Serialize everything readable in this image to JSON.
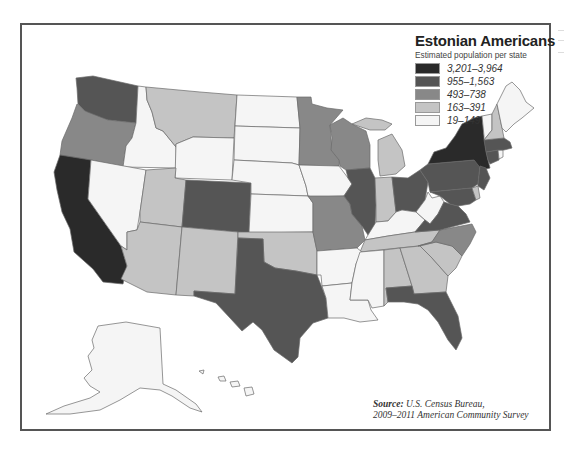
{
  "legend": {
    "title": "Estonian Americans",
    "subtitle": "Estimated population per state",
    "classes": [
      {
        "label": "3,201–3,964",
        "color": "#2a2a2a"
      },
      {
        "label": "955–1,563",
        "color": "#555555"
      },
      {
        "label": "493–738",
        "color": "#888888"
      },
      {
        "label": "163–391",
        "color": "#c4c4c4"
      },
      {
        "label": "19–149",
        "color": "#f5f5f5"
      }
    ]
  },
  "source": {
    "prefix": "Source:",
    "line1": "U.S. Census Bureau,",
    "line2": "2009–2011 American Community Survey"
  },
  "states": {
    "CA": 0,
    "NY": 0,
    "WA": 1,
    "CO": 1,
    "TX": 1,
    "IL": 1,
    "OH": 1,
    "PA": 1,
    "VA": 1,
    "NJ": 1,
    "MD": 1,
    "FL": 1,
    "MA": 1,
    "CT": 1,
    "OR": 2,
    "MN": 2,
    "WI": 2,
    "MO": 2,
    "NC": 2,
    "MT": 3,
    "UT": 3,
    "AZ": 3,
    "NM": 3,
    "OK": 3,
    "MI": 3,
    "IN": 3,
    "TN": 3,
    "AL": 3,
    "GA": 3,
    "SC": 3,
    "NH": 3,
    "DE": 3,
    "ID": 4,
    "NV": 4,
    "WY": 4,
    "ND": 4,
    "SD": 4,
    "NE": 4,
    "KS": 4,
    "IA": 4,
    "AR": 4,
    "LA": 4,
    "MS": 4,
    "KY": 4,
    "WV": 4,
    "ME": 4,
    "VT": 4,
    "RI": 4,
    "AK": 4,
    "HI": 4
  }
}
